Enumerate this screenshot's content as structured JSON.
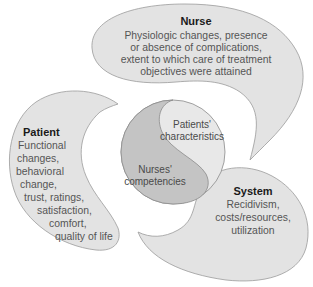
{
  "diagram": {
    "colors": {
      "petal_fill": "#e3e3e3",
      "petal_stroke": "#9a9a9a",
      "circle_dark": "#c4c4c4",
      "circle_light": "#e8e8e8",
      "title_text": "#1a1a1a",
      "body_text": "#555555"
    },
    "nurse": {
      "title": "Nurse",
      "lines": [
        "Physiologic changes, presence",
        "or absence of complications,",
        "extent to which care of treatment",
        "objectives were attained"
      ]
    },
    "patient": {
      "title": "Patient",
      "lines": [
        "Functional",
        "changes,",
        "behavioral",
        "change,",
        "trust, ratings,",
        "satisfaction,",
        "comfort,",
        "quality of life"
      ]
    },
    "system": {
      "title": "System",
      "lines": [
        "Recidivism,",
        "costs/resources,",
        "utilization"
      ]
    },
    "center": {
      "upper": [
        "Patients'",
        "characteristics"
      ],
      "lower": [
        "Nurses'",
        "competencies"
      ]
    }
  }
}
